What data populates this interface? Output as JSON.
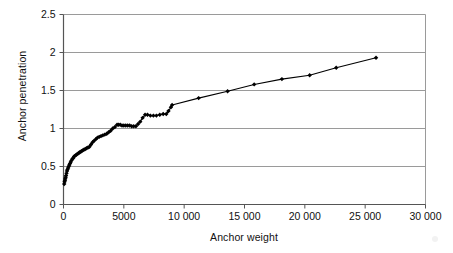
{
  "chart_data": {
    "type": "line",
    "title": "",
    "xlabel": "Anchor weight",
    "ylabel": "Anchor penetration",
    "xlim": [
      0,
      30000
    ],
    "ylim": [
      0,
      2.5
    ],
    "xticks": [
      0,
      5000,
      10000,
      15000,
      20000,
      25000,
      30000
    ],
    "xtick_labels": [
      "0",
      "5000",
      "10 000",
      "15 000",
      "20 000",
      "25 000",
      "30 000"
    ],
    "yticks": [
      0,
      0.5,
      1,
      1.5,
      2,
      2.5
    ],
    "ytick_labels": [
      "0",
      "0.5",
      "1",
      "1.5",
      "2",
      "2.5"
    ],
    "grid": "horizontal",
    "legend": "none",
    "marker": "diamond",
    "line_color": "#000000",
    "marker_color": "#000000",
    "grid_color": "#9a9a9a",
    "axis_color": "#555555",
    "series": [
      {
        "name": "Anchor penetration",
        "x": [
          60,
          90,
          120,
          150,
          180,
          210,
          250,
          290,
          330,
          380,
          430,
          480,
          540,
          600,
          660,
          730,
          800,
          870,
          950,
          1030,
          1110,
          1200,
          1290,
          1380,
          1480,
          1580,
          1690,
          1800,
          1910,
          2030,
          2150,
          2280,
          2410,
          2540,
          2680,
          2820,
          2960,
          3110,
          3260,
          3420,
          3580,
          3740,
          3910,
          4080,
          4260,
          4440,
          4560,
          4700,
          4850,
          5000,
          5160,
          5320,
          5480,
          5650,
          5820,
          6000,
          6180,
          6360,
          6560,
          6760,
          6960,
          7200,
          7450,
          7700,
          7980,
          8260,
          8520,
          8700,
          8900,
          9000,
          11200,
          13600,
          15800,
          18100,
          20400,
          22600,
          25900
        ],
        "y": [
          0.27,
          0.3,
          0.32,
          0.34,
          0.36,
          0.38,
          0.41,
          0.44,
          0.46,
          0.48,
          0.5,
          0.52,
          0.54,
          0.56,
          0.58,
          0.6,
          0.61,
          0.63,
          0.64,
          0.65,
          0.66,
          0.67,
          0.68,
          0.69,
          0.7,
          0.71,
          0.72,
          0.73,
          0.74,
          0.75,
          0.76,
          0.79,
          0.82,
          0.84,
          0.86,
          0.88,
          0.89,
          0.9,
          0.91,
          0.92,
          0.93,
          0.95,
          0.97,
          1.0,
          1.02,
          1.05,
          1.05,
          1.05,
          1.04,
          1.04,
          1.04,
          1.04,
          1.04,
          1.03,
          1.03,
          1.03,
          1.06,
          1.09,
          1.14,
          1.18,
          1.18,
          1.17,
          1.17,
          1.17,
          1.18,
          1.19,
          1.19,
          1.23,
          1.28,
          1.31,
          1.4,
          1.49,
          1.58,
          1.65,
          1.7,
          1.8,
          1.93
        ]
      }
    ]
  }
}
